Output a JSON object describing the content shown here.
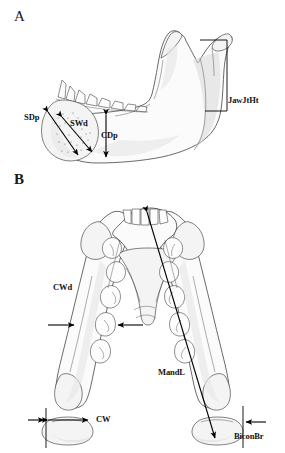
{
  "figure": {
    "background_color": "#ffffff",
    "line_color": "#2a2a2a",
    "label_color": "#111111",
    "panels": [
      {
        "id": "A",
        "letter": "A",
        "view": "lateral view of hemi-mandible",
        "measurements": [
          {
            "abbr": "SDp",
            "name": "symphysis-depth",
            "arrow": "double-headed-diagonal",
            "region": "mandibular symphysis cross-section"
          },
          {
            "abbr": "SWd",
            "name": "symphysis-width",
            "arrow": "double-headed-diagonal",
            "region": "mandibular symphysis cross-section"
          },
          {
            "abbr": "CDp",
            "name": "corpus-depth",
            "arrow": "double-headed-vertical",
            "region": "mandibular corpus below tooth row"
          },
          {
            "abbr": "JawJtHt",
            "name": "jaw-joint-height",
            "arrow": "bracket-vertical",
            "region": "posterior ramus to condyle"
          }
        ]
      },
      {
        "id": "B",
        "letter": "B",
        "view": "superior (occlusal) view of mandible",
        "measurements": [
          {
            "abbr": "CWd",
            "name": "corpus-width",
            "arrow": "opposing-horizontal-pair",
            "region": "mandibular corpus at molar row"
          },
          {
            "abbr": "MandL",
            "name": "mandible-length",
            "arrow": "double-headed-diagonal",
            "region": "incisors to condyle"
          },
          {
            "abbr": "CW",
            "name": "condyle-width",
            "arrow": "double-headed-horizontal",
            "region": "left condyle"
          },
          {
            "abbr": "BiconBr",
            "name": "bicondylar-breadth",
            "arrow": "single-headed-horizontal",
            "region": "right condyle lateral margin"
          }
        ]
      }
    ]
  }
}
